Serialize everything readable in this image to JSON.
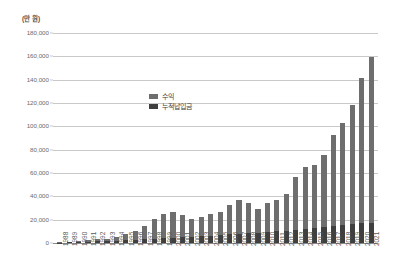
{
  "chart_data": {
    "type": "bar",
    "stacked": true,
    "title": "",
    "subtitle": "",
    "unit_label": "(만 원)",
    "xlabel": "",
    "ylabel": "",
    "ylim": [
      0,
      180000
    ],
    "ytick_step": 20000,
    "grid": true,
    "legend_position": "inside-center-left",
    "categories": [
      "1988",
      "1989",
      "1990",
      "1991",
      "1992",
      "1993",
      "1994",
      "1995",
      "1996",
      "1997",
      "1998",
      "1999",
      "2000",
      "2001",
      "2002",
      "2003",
      "2004",
      "2005",
      "2006",
      "2007",
      "2008",
      "2009",
      "2010",
      "2011",
      "2012",
      "2013",
      "2014",
      "2015",
      "2016",
      "2017",
      "2018",
      "2019",
      "2020",
      "2021"
    ],
    "ytick_labels": [
      "180,000",
      "160,000",
      "140,000",
      "120,000",
      "100,000",
      "80,000",
      "60,000",
      "40,000",
      "20,000",
      "0"
    ],
    "ytick_values": [
      180000,
      160000,
      140000,
      120000,
      100000,
      80000,
      60000,
      40000,
      20000,
      0
    ],
    "series": [
      {
        "name": "누적납입금",
        "color": "#3f3f3f",
        "values": [
          300,
          500,
          800,
          1100,
          1400,
          1700,
          2000,
          2400,
          2800,
          3200,
          3600,
          4100,
          4600,
          5000,
          5400,
          5800,
          6300,
          6800,
          7300,
          7800,
          8300,
          8800,
          9300,
          9900,
          10500,
          11200,
          12000,
          12800,
          13600,
          14500,
          15400,
          16200,
          16800,
          17300
        ]
      },
      {
        "name": "수익",
        "color": "#6e6e6e",
        "values": [
          200,
          400,
          700,
          1500,
          1700,
          1900,
          2800,
          5200,
          7200,
          11600,
          16800,
          20900,
          21600,
          19300,
          15600,
          16200,
          19000,
          20200,
          25000,
          28900,
          25600,
          20400,
          24600,
          26700,
          31200,
          45800,
          53000,
          54400,
          61800,
          78500,
          87800,
          102300,
          125000,
          142200
        ]
      }
    ],
    "totals": [
      500,
      900,
      1500,
      2600,
      3100,
      3600,
      4800,
      7600,
      10000,
      14800,
      20400,
      25000,
      26200,
      24300,
      21000,
      22000,
      25300,
      27000,
      32300,
      36700,
      33900,
      29200,
      33900,
      36600,
      41700,
      57000,
      65000,
      67200,
      75400,
      93000,
      103200,
      118500,
      141800,
      159500
    ],
    "legend": [
      {
        "label": "수익",
        "color": "#6e6e6e"
      },
      {
        "label": "누적납입금",
        "color": "#3f3f3f"
      }
    ]
  }
}
